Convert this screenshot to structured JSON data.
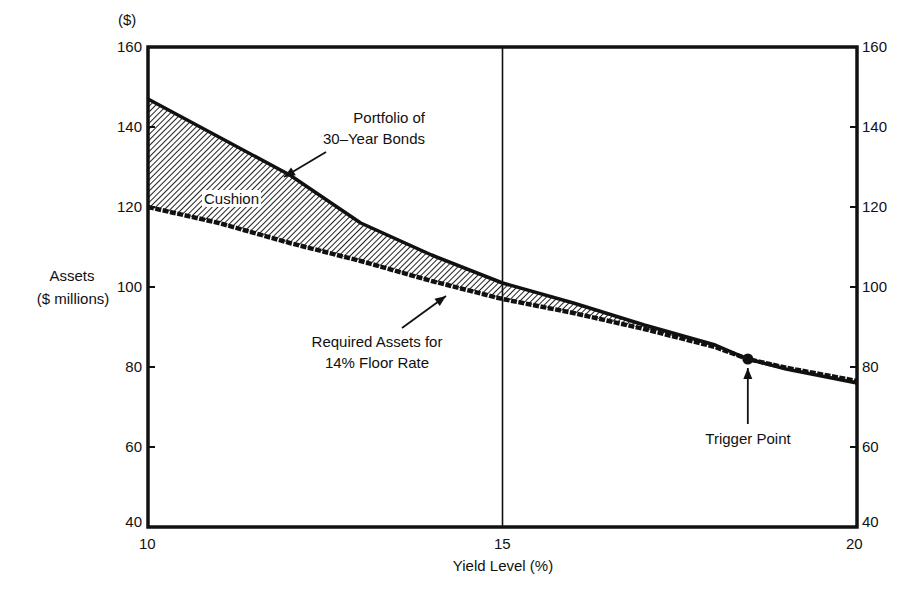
{
  "chart_data": {
    "type": "area",
    "title": "",
    "xlabel": "Yield Level (%)",
    "ylabel": "Assets\n($ millions)",
    "ylabel_line1": "Assets",
    "ylabel_line2": "($ millions)",
    "y_unit_label": "($)",
    "xlim": [
      10,
      20
    ],
    "ylim": [
      40,
      160
    ],
    "x_ticks": [
      10,
      15,
      20
    ],
    "y_ticks": [
      40,
      60,
      80,
      100,
      120,
      140,
      160
    ],
    "y_ticks_right": [
      40,
      60,
      80,
      100,
      120,
      140,
      160
    ],
    "grid": false,
    "reference_line_x": 15,
    "series": [
      {
        "name": "Portfolio of 30-Year Bonds",
        "style": "solid",
        "x": [
          10,
          11,
          12,
          13,
          14,
          15,
          16,
          17,
          18,
          18.46,
          19,
          20
        ],
        "values": [
          147,
          137.5,
          128,
          116,
          108,
          101,
          96,
          90.5,
          85.5,
          82,
          79.5,
          76
        ]
      },
      {
        "name": "Required Assets for 14% Floor Rate",
        "style": "dashed-thick",
        "x": [
          10,
          11,
          12,
          13,
          14,
          15,
          16,
          17,
          18,
          18.46,
          19,
          20
        ],
        "values": [
          120,
          116,
          111,
          106.5,
          101.5,
          97,
          93.5,
          89.5,
          85,
          82,
          79.8,
          76.5
        ]
      }
    ],
    "shaded_region": {
      "label": "Cushion",
      "between": [
        "Portfolio of 30-Year Bonds",
        "Required Assets for 14% Floor Rate"
      ],
      "pattern": "diagonal-hatch"
    },
    "annotations": [
      {
        "text": "Portfolio of\n30-Year Bonds",
        "line1": "Portfolio of",
        "line2": "30-Year Bonds",
        "arrow_to": [
          11.9,
          128
        ]
      },
      {
        "text": "Required Assets for\n14% Floor Rate",
        "line1": "Required Assets for",
        "line2": "14% Floor Rate",
        "arrow_to": [
          14.2,
          98.5
        ]
      },
      {
        "text": "Cushion"
      },
      {
        "text": "Trigger Point",
        "point": [
          18.46,
          82
        ]
      }
    ]
  },
  "labels": {
    "y_unit": "($)",
    "y_title_1": "Assets",
    "y_title_2": "($ millions)",
    "x_title": "Yield Level (%)",
    "cushion": "Cushion",
    "portfolio_1": "Portfolio of",
    "portfolio_2": "30–Year Bonds",
    "required_1": "Required Assets for",
    "required_2": "14% Floor Rate",
    "trigger": "Trigger Point",
    "x_tick_10": "10",
    "x_tick_15": "15",
    "x_tick_20": "20"
  }
}
